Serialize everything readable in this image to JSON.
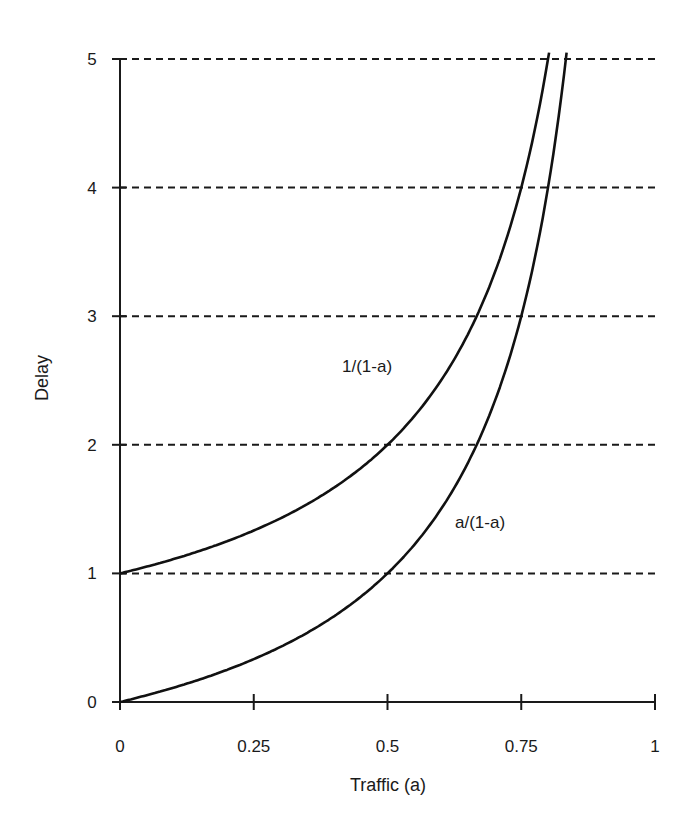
{
  "chart_data": {
    "type": "line",
    "title": "",
    "xlabel": "Traffic (a)",
    "ylabel": "Delay",
    "xlim": [
      0,
      1
    ],
    "ylim": [
      0,
      5
    ],
    "x_ticks": [
      "0",
      "0.25",
      "0.5",
      "0.75",
      "1"
    ],
    "y_ticks": [
      "0",
      "1",
      "2",
      "3",
      "4",
      "5"
    ],
    "grid": {
      "horizontal": true,
      "style": "dashed",
      "at": [
        1,
        2,
        3,
        4,
        5
      ]
    },
    "legend": "none (inline curve labels)",
    "series": [
      {
        "name": "1/(1-a)",
        "x": [
          0,
          0.1,
          0.2,
          0.25,
          0.3,
          0.4,
          0.5,
          0.6,
          0.65,
          0.7,
          0.75,
          0.8
        ],
        "values": [
          1.0,
          1.11,
          1.25,
          1.33,
          1.43,
          1.67,
          2.0,
          2.5,
          2.86,
          3.33,
          4.0,
          5.0
        ]
      },
      {
        "name": "a/(1-a)",
        "x": [
          0,
          0.1,
          0.2,
          0.3,
          0.4,
          0.5,
          0.6,
          0.65,
          0.7,
          0.75,
          0.8,
          0.833
        ],
        "values": [
          0,
          0.11,
          0.25,
          0.43,
          0.67,
          1.0,
          1.5,
          1.86,
          2.33,
          3.0,
          4.0,
          5.0
        ]
      }
    ],
    "annotations": [
      {
        "text": "1/(1-a)",
        "near_series": "1/(1-a)"
      },
      {
        "text": "a/(1-a)",
        "near_series": "a/(1-a)"
      }
    ]
  }
}
